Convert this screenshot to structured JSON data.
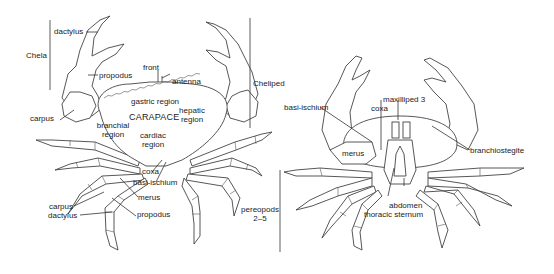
{
  "dorsal_view": {
    "brackets": {
      "chela": "Chela",
      "cheliped": "Cheliped"
    },
    "labels": {
      "dactylus_claw": "dactylus",
      "propodus_claw": "propodus",
      "carpus_claw": "carpus",
      "front": "front",
      "antenna": "antenna",
      "gastric": "gastric region",
      "carapace": "CARAPACE",
      "hepatic_1": "hepatic",
      "hepatic_2": "region",
      "branchial_1": "branchial",
      "branchial_2": "region",
      "cardiac_1": "cardiac",
      "cardiac_2": "region",
      "coxa": "coxa",
      "basi_ischium": "basi-ischium",
      "merus": "merus",
      "carpus_leg": "carpus",
      "propodus_leg": "propodus",
      "dactylus_leg": "dactylus"
    }
  },
  "ventral_view": {
    "brackets": {
      "pereopods_1": "pereopods",
      "pereopods_2": "2–5"
    },
    "labels": {
      "basi_ischium": "basi-ischium",
      "maxilliped": "maxilliped 3",
      "coxa": "coxa",
      "merus": "merus",
      "branchiostegite": "branchiostegite",
      "abdomen": "abdomen",
      "thoracic_sternum": "thoracic sternum"
    }
  }
}
